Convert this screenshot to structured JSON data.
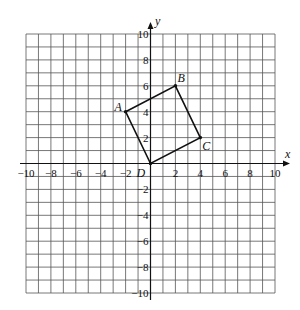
{
  "header_text": "",
  "axes": {
    "x_label": "x",
    "y_label": "y",
    "x_ticks": [
      "−10",
      "−8",
      "−6",
      "−4",
      "−2",
      "2",
      "4",
      "6",
      "8",
      "10"
    ],
    "y_ticks": [
      "10",
      "8",
      "6",
      "4",
      "2",
      "−2",
      "−4",
      "−6",
      "−8",
      "−10"
    ],
    "range": [
      -10,
      10
    ]
  },
  "points": [
    {
      "name": "A",
      "x": -2,
      "y": 4
    },
    {
      "name": "B",
      "x": 2,
      "y": 6
    },
    {
      "name": "C",
      "x": 4,
      "y": 2
    },
    {
      "name": "D",
      "x": 0,
      "y": 0
    }
  ]
}
